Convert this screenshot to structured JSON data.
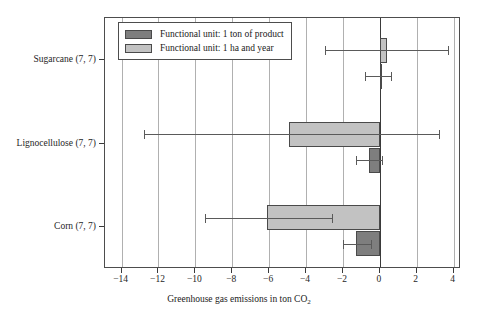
{
  "chart_data": {
    "type": "bar",
    "orientation": "horizontal",
    "title": "",
    "xlabel": "Greenhouse gas emissions in ton CO2",
    "xlabel_base": "Greenhouse gas emissions in ton CO",
    "xlabel_sub": "2",
    "ylabel": "",
    "categories": [
      "Sugarcane (7, 7)",
      "Lignocellulose (7, 7)",
      "Corn (7, 7)"
    ],
    "xlim": [
      -14.9,
      4.4
    ],
    "xticks": [
      -14,
      -12,
      -10,
      -8,
      -6,
      -4,
      -2,
      0,
      2,
      4
    ],
    "xticklabels": [
      "−14",
      "−12",
      "−10",
      "−8",
      "−6",
      "−4",
      "−2",
      "0",
      "2",
      "4"
    ],
    "grid": "vertical",
    "legend_position": "upper-left-inside",
    "series": [
      {
        "name": "Functional unit: 1 ton of product",
        "key": "dark",
        "color": "#7e7e7e",
        "values": [
          0.05,
          -0.6,
          -1.3
        ],
        "err_low": [
          -0.8,
          -1.3,
          -2.0
        ],
        "err_high": [
          0.6,
          0.1,
          -0.5
        ]
      },
      {
        "name": "Functional unit: 1 ha and year",
        "key": "light",
        "color": "#c2c2c2",
        "values": [
          0.4,
          -4.9,
          -6.1
        ],
        "err_low": [
          -3.0,
          -12.8,
          -9.5
        ],
        "err_high": [
          3.7,
          3.2,
          -2.6
        ]
      }
    ]
  },
  "legend": {
    "items": [
      {
        "label": "Functional unit: 1 ton of product",
        "swatch": "dark"
      },
      {
        "label": "Functional unit: 1 ha and year",
        "swatch": "light"
      }
    ]
  },
  "axis": {
    "x_title_base": "Greenhouse gas emissions in ton CO",
    "x_title_sub": "2"
  }
}
